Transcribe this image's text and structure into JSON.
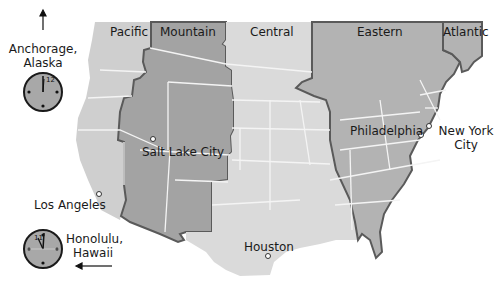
{
  "zones": [
    {
      "id": "pacific",
      "label": "Pacific",
      "color": "#cfcfcf"
    },
    {
      "id": "mountain",
      "label": "Mountain",
      "color": "#a3a3a3"
    },
    {
      "id": "central",
      "label": "Central",
      "color": "#dadada"
    },
    {
      "id": "eastern",
      "label": "Eastern",
      "color": "#b3b3b3"
    },
    {
      "id": "atlantic",
      "label": "Atlantic",
      "color": "#b3b3b3"
    }
  ],
  "cities": [
    {
      "name": "Salt Lake City"
    },
    {
      "name": "Los Angeles"
    },
    {
      "name": "Houston"
    },
    {
      "name": "Philadelphia"
    },
    {
      "name": "New York City",
      "line1": "New York",
      "line2": "City"
    }
  ],
  "insets": {
    "alaska": {
      "line1": "Anchorage,",
      "line2": "Alaska",
      "clock_label": "12",
      "arrow": "up"
    },
    "hawaii": {
      "line1": "Honolulu,",
      "line2": "Hawaii",
      "clock_label": "11",
      "arrow": "left"
    }
  },
  "colors": {
    "border": "#5a5a5a",
    "state_lines": "#f4f4f4",
    "clock_face": "#a8a8a8"
  }
}
